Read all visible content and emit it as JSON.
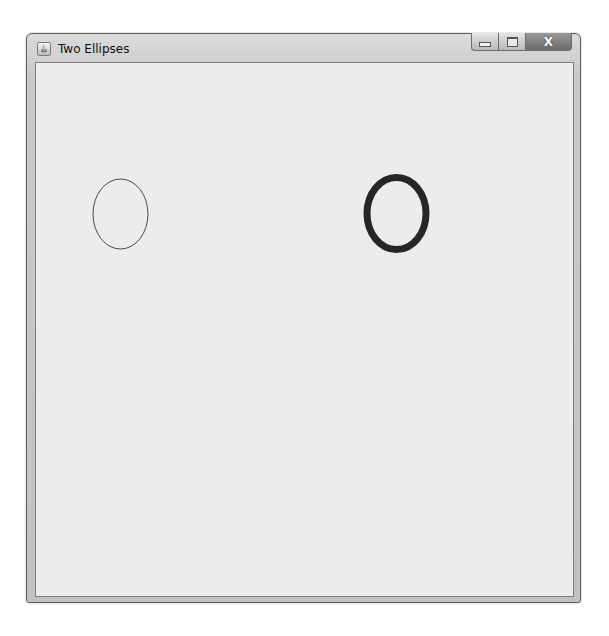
{
  "window": {
    "title": "Two Ellipses",
    "icon": "java-app-icon",
    "controls": {
      "minimize": "minimize-icon",
      "maximize": "maximize-icon",
      "close_label": "X"
    }
  },
  "canvas": {
    "background": "#ececec",
    "ellipses": [
      {
        "name": "thin-ellipse",
        "cx": 119.5,
        "cy": 213,
        "rx": 27.5,
        "ry": 35,
        "stroke": "#4a4a4a",
        "stroke_width": 1
      },
      {
        "name": "thick-ellipse",
        "cx": 395.5,
        "cy": 212.5,
        "rx": 29.5,
        "ry": 36,
        "stroke": "#262626",
        "stroke_width": 7
      }
    ]
  }
}
